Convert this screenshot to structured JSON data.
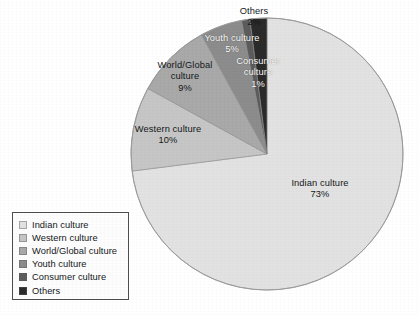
{
  "chart_data": {
    "type": "pie",
    "title": "",
    "subtitle": "",
    "xlabel": "",
    "ylabel": "",
    "legend_position": "bottom-left",
    "grid": false,
    "units": "percent",
    "total": 100,
    "start_angle_deg": 0,
    "direction": "clockwise",
    "categories": [
      "Indian culture",
      "Western culture",
      "World/Global culture",
      "Youth culture",
      "Consumer culture",
      "Others"
    ],
    "values": [
      73,
      10,
      9,
      5,
      1,
      2
    ],
    "colors": [
      "#e2e2e2",
      "#c6c6c6",
      "#a9a9a9",
      "#8c8c8c",
      "#5c5c5c",
      "#2b2b2b"
    ],
    "slices": [
      {
        "label": "Indian culture",
        "value": 73,
        "display": "73%",
        "color": "#e2e2e2",
        "label_on_dark": false
      },
      {
        "label": "Western culture",
        "value": 10,
        "display": "10%",
        "color": "#c6c6c6",
        "label_on_dark": false
      },
      {
        "label": "World/Global culture",
        "value": 9,
        "display": "9%",
        "color": "#a9a9a9",
        "label_on_dark": false
      },
      {
        "label": "Youth culture",
        "value": 5,
        "display": "5%",
        "color": "#8c8c8c",
        "label_on_dark": true
      },
      {
        "label": "Consumer culture",
        "value": 1,
        "display": "1%",
        "color": "#5c5c5c",
        "label_on_dark": true
      },
      {
        "label": "Others",
        "value": 2,
        "display": "2%",
        "color": "#2b2b2b",
        "label_on_dark": true
      }
    ]
  },
  "labels": {
    "others": {
      "name": "Others",
      "pct": "2%"
    },
    "youth": {
      "name": "Youth culture",
      "pct": "5%"
    },
    "consumer_l1": {
      "name": "Consumer",
      "l2": "culture",
      "pct": "1%"
    },
    "world_l1": {
      "name": "World/Global",
      "l2": "culture",
      "pct": "9%"
    },
    "western": {
      "name": "Western culture",
      "pct": "10%"
    },
    "indian": {
      "name": "Indian culture",
      "pct": "73%"
    }
  },
  "legend": {
    "items": [
      {
        "label": "Indian culture",
        "color": "#e2e2e2"
      },
      {
        "label": "Western culture",
        "color": "#c6c6c6"
      },
      {
        "label": "World/Global culture",
        "color": "#a9a9a9"
      },
      {
        "label": "Youth culture",
        "color": "#8c8c8c"
      },
      {
        "label": "Consumer culture",
        "color": "#5c5c5c"
      },
      {
        "label": "Others",
        "color": "#2b2b2b"
      }
    ]
  }
}
